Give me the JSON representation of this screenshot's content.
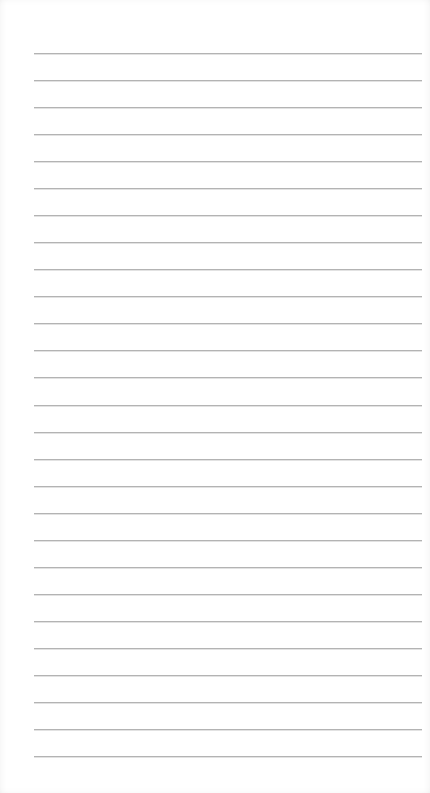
{
  "page": {
    "type": "lined-paper",
    "background_color": "#ffffff",
    "line_color": "#b3b3b3",
    "line_count": 27,
    "first_line_y": 53,
    "line_spacing": 27.04,
    "line_left_x": 34,
    "line_right_x": 422,
    "text_content": []
  }
}
